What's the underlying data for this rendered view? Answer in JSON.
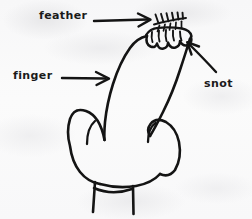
{
  "image": {
    "kind": "hand-drawn-annotated-diagram",
    "subject": "raised middle finger with a feather and snot on the fingertip",
    "background_color": "#fafafa",
    "ink_color": "#141414",
    "width": 252,
    "height": 219
  },
  "annotations": [
    {
      "id": "feather",
      "label": "feather",
      "pointer": "arrow",
      "direction": "right",
      "points_to": "feather-shape at fingertip"
    },
    {
      "id": "finger",
      "label": "finger",
      "pointer": "arrow",
      "direction": "right",
      "points_to": "raised middle finger"
    },
    {
      "id": "snot",
      "label": "snot",
      "pointer": "arrow",
      "direction": "up-left",
      "points_to": "squiggly blob on fingertip"
    }
  ],
  "drawing_parts": [
    {
      "id": "feather-shape",
      "name": "feather"
    },
    {
      "id": "snot-shape",
      "name": "snot-squiggle"
    },
    {
      "id": "middle-finger",
      "name": "extended-middle-finger"
    },
    {
      "id": "fist",
      "name": "closed-fist"
    },
    {
      "id": "knuckle-index",
      "name": "index-knuckle-line"
    },
    {
      "id": "knuckle-ring",
      "name": "ring-knuckle-line"
    },
    {
      "id": "wrist-cuff",
      "name": "wrist-cuff"
    }
  ]
}
